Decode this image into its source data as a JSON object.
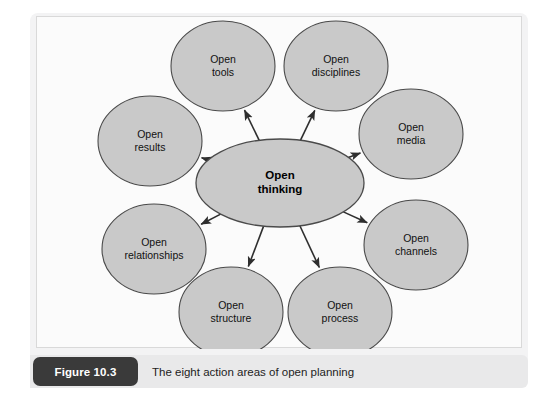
{
  "figure": {
    "badge_label": "Figure 10.3",
    "caption": "The eight action areas of open planning"
  },
  "diagram": {
    "type": "hub-and-spoke",
    "center": {
      "id": "open-thinking",
      "label_line1": "Open",
      "label_line2": "thinking",
      "cx": 243,
      "cy": 166,
      "rx": 84,
      "ry": 44
    },
    "node_shape": {
      "rx": 52,
      "ry": 45
    },
    "nodes": [
      {
        "id": "open-tools",
        "label_line1": "Open",
        "label_line2": "tools",
        "cx": 186,
        "cy": 49
      },
      {
        "id": "open-disciplines",
        "label_line1": "Open",
        "label_line2": "disciplines",
        "cx": 299,
        "cy": 49
      },
      {
        "id": "open-media",
        "label_line1": "Open",
        "label_line2": "media",
        "cx": 374,
        "cy": 117
      },
      {
        "id": "open-channels",
        "label_line1": "Open",
        "label_line2": "channels",
        "cx": 379,
        "cy": 228
      },
      {
        "id": "open-process",
        "label_line1": "Open",
        "label_line2": "process",
        "cx": 303,
        "cy": 295
      },
      {
        "id": "open-structure",
        "label_line1": "Open",
        "label_line2": "structure",
        "cx": 194,
        "cy": 295
      },
      {
        "id": "open-relationships",
        "label_line1": "Open",
        "label_line2": "relationships",
        "cx": 117,
        "cy": 232
      },
      {
        "id": "open-results",
        "label_line1": "Open",
        "label_line2": "results",
        "cx": 113,
        "cy": 124
      }
    ],
    "arrow_direction": "outward-from-center",
    "colors": {
      "node_fill": "#c9c9c9",
      "node_stroke": "#4a4a4a",
      "connector": "#2e2e2e",
      "canvas": "#fbfbfb",
      "panel": "#f3f3f4",
      "caption_bar": "#e9e9ea",
      "badge": "#3a3a3a",
      "badge_text": "#ffffff"
    }
  }
}
